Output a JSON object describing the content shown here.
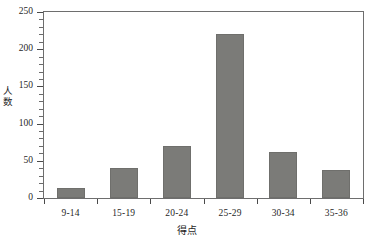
{
  "chart_data": {
    "type": "bar",
    "title": "",
    "subtitle": "",
    "xlabel": "得点",
    "ylabel": "人数",
    "categories": [
      "9-14",
      "15-19",
      "20-24",
      "25-29",
      "30-34",
      "35-36"
    ],
    "values": [
      13,
      40,
      70,
      220,
      62,
      37
    ],
    "series": [
      {
        "name": "人数",
        "values": [
          13,
          40,
          70,
          220,
          62,
          37
        ]
      }
    ],
    "ylim": [
      0,
      250
    ],
    "y_ticks": [
      0,
      50,
      100,
      150,
      200,
      250
    ],
    "y_tick_labels": [
      "0",
      "50",
      "100",
      "150",
      "200",
      "250"
    ],
    "y_minor_tick_interval": 10,
    "grid": false,
    "legend": false,
    "legend_position": "none",
    "bar_color": "#7b7b78",
    "bar_edge_color": "#6f6f6c",
    "axis_color": "#4a4a4a",
    "background_color": "#ffffff",
    "text_color": "#1f1f1f",
    "frame": true
  },
  "axes": {
    "y_title_chars": [
      "人",
      "数"
    ],
    "x_title": "得点"
  }
}
